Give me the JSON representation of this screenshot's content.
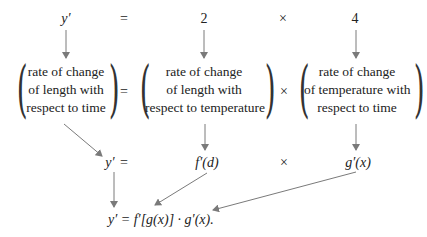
{
  "top_row": {
    "lhs": "y′",
    "eq": "=",
    "factor1": "2",
    "times": "×",
    "factor2": "4"
  },
  "word_row": {
    "box1": [
      "rate of change",
      "of length with",
      "respect to time"
    ],
    "eq": "=",
    "box2": [
      "rate of change",
      "of length with",
      "respect to temperature"
    ],
    "times": "×",
    "box3": [
      "rate of change",
      "of temperature with",
      "respect to time"
    ]
  },
  "symbol_row": {
    "lhs": "y′",
    "eq": "=",
    "factor1": "f′(d)",
    "times": "×",
    "factor2": "g′(x)"
  },
  "result": {
    "formula": "y′ = f′[g(x)] · g′(x)."
  },
  "colors": {
    "arrow": "#7a7a7a",
    "text": "#222222"
  }
}
